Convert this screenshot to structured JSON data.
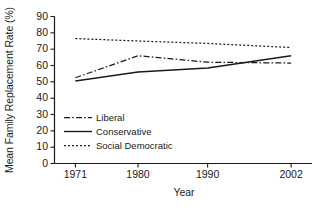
{
  "chart_data": {
    "type": "line",
    "title": "",
    "xlabel": "Year",
    "ylabel": "Mean Family Replacement Rate (%)",
    "x": [
      1971,
      1980,
      1990,
      2002
    ],
    "xlim": [
      1968,
      2005
    ],
    "ylim": [
      0,
      90
    ],
    "ytick_labels": [
      "0",
      "10",
      "20",
      "30",
      "40",
      "50",
      "60",
      "70",
      "80",
      "90"
    ],
    "yticks": [
      0,
      10,
      20,
      30,
      40,
      50,
      60,
      70,
      80,
      90
    ],
    "xtick_labels": [
      "1971",
      "1980",
      "1990",
      "2002"
    ],
    "xticks": [
      1971,
      1980,
      1990,
      2002
    ],
    "grid": false,
    "legend_position": "inside-lower-left",
    "series": [
      {
        "name": "Liberal",
        "style": "dash-dot",
        "color": "#1a1a1a",
        "values": [
          52.5,
          66.0,
          62.0,
          61.5
        ]
      },
      {
        "name": "Conservative",
        "style": "solid",
        "color": "#1a1a1a",
        "values": [
          50.5,
          56.0,
          58.5,
          66.0
        ]
      },
      {
        "name": "Social Democratic",
        "style": "dotted",
        "color": "#1a1a1a",
        "values": [
          76.5,
          75.0,
          73.5,
          71.0
        ]
      }
    ]
  },
  "axis": {
    "ylabel": "Mean Family Replacement Rate (%)",
    "xlabel": "Year",
    "ytick_0": "0",
    "ytick_10": "10",
    "ytick_20": "20",
    "ytick_30": "30",
    "ytick_40": "40",
    "ytick_50": "50",
    "ytick_60": "60",
    "ytick_70": "70",
    "ytick_80": "80",
    "ytick_90": "90",
    "xtick_1971": "1971",
    "xtick_1980": "1980",
    "xtick_1990": "1990",
    "xtick_2002": "2002"
  },
  "legend": {
    "items": [
      {
        "label": "Liberal",
        "style": "dash-dot"
      },
      {
        "label": "Conservative",
        "style": "solid"
      },
      {
        "label": "Social Democratic",
        "style": "dotted"
      }
    ]
  }
}
